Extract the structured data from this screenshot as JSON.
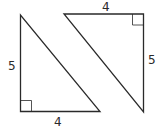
{
  "diagram": {
    "stroke_color": "#2a2a2a",
    "triangles": [
      {
        "name": "left-triangle",
        "vertices": [
          [
            20.5,
            15
          ],
          [
            20.5,
            111.5
          ],
          [
            100,
            111.5
          ]
        ],
        "right_angle_at": [
          20.5,
          111.5
        ],
        "labels": {
          "vertical_leg": "5",
          "horizontal_leg": "4"
        }
      },
      {
        "name": "right-triangle",
        "vertices": [
          [
            64,
            14
          ],
          [
            143.5,
            14
          ],
          [
            143.5,
            112
          ]
        ],
        "right_angle_at": [
          143.5,
          14
        ],
        "labels": {
          "horizontal_leg": "4",
          "vertical_leg": "5"
        }
      }
    ]
  }
}
